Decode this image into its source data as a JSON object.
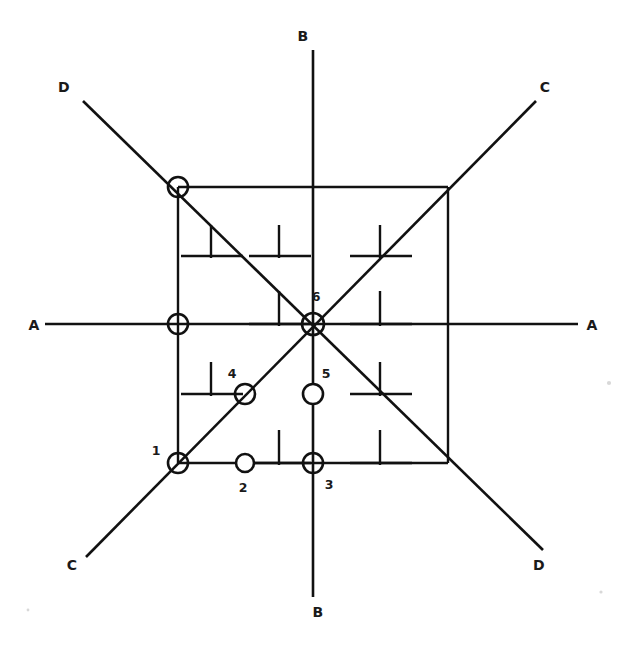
{
  "figure": {
    "type": "engineering-grid-diagram",
    "background_color": "#ffffff",
    "line_color": "#111111",
    "width": 629,
    "height": 659
  },
  "axis_labels": [
    {
      "id": "A-left",
      "text": "A",
      "x": 40,
      "y": 325
    },
    {
      "id": "A-right",
      "text": "A",
      "x": 592,
      "y": 325
    },
    {
      "id": "B-top",
      "text": "B",
      "x": 303,
      "y": 40
    },
    {
      "id": "B-bottom",
      "text": "B",
      "x": 303,
      "y": 615
    },
    {
      "id": "C-top-right",
      "text": "C",
      "x": 541,
      "y": 90
    },
    {
      "id": "C-bottom-left",
      "text": "C",
      "x": 72,
      "y": 568
    },
    {
      "id": "D-top-left",
      "text": "D",
      "x": 64,
      "y": 90
    },
    {
      "id": "D-bottom-right",
      "text": "D",
      "x": 537,
      "y": 568
    }
  ],
  "node_labels": [
    {
      "id": "label-1",
      "text": "1",
      "x": 155,
      "y": 455
    },
    {
      "id": "label-2",
      "text": "2",
      "x": 241,
      "y": 491
    },
    {
      "id": "label-3",
      "text": "3",
      "x": 327,
      "y": 488
    },
    {
      "id": "label-4",
      "text": "4",
      "x": 232,
      "y": 377
    },
    {
      "id": "label-5",
      "text": "5",
      "x": 325,
      "y": 377
    },
    {
      "id": "label-6",
      "text": "6",
      "x": 315,
      "y": 300
    }
  ],
  "nodes": [
    {
      "id": "node-corner-tl",
      "label": "",
      "cx": 178,
      "cy": 187,
      "r": 10
    },
    {
      "id": "node-mid-left",
      "label": "",
      "cx": 178,
      "cy": 324,
      "r": 10
    },
    {
      "id": "node-1",
      "label": "1",
      "cx": 178,
      "cy": 463,
      "r": 10
    },
    {
      "id": "node-2",
      "label": "2",
      "cx": 245,
      "cy": 463,
      "r": 9
    },
    {
      "id": "node-3",
      "label": "3",
      "cx": 313,
      "cy": 463,
      "r": 10
    },
    {
      "id": "node-4",
      "label": "4",
      "cx": 245,
      "cy": 394,
      "r": 10
    },
    {
      "id": "node-5",
      "label": "5",
      "cx": 313,
      "cy": 394,
      "r": 10
    },
    {
      "id": "node-6",
      "label": "6",
      "cx": 313,
      "cy": 324,
      "r": 11
    }
  ],
  "square": {
    "left": 178,
    "top": 187,
    "right": 448,
    "bottom": 463
  },
  "axes": {
    "horizontal_A": {
      "x1": 45,
      "y1": 324,
      "x2": 578,
      "y2": 324
    },
    "vertical_B": {
      "x1": 313,
      "y1": 50,
      "x2": 313,
      "y2": 597
    },
    "diagonal_D": {
      "x1": 83,
      "y1": 101,
      "x2": 543,
      "y2": 550
    },
    "diagonal_C": {
      "x1": 86,
      "y1": 557,
      "x2": 536,
      "y2": 101
    }
  },
  "tick_marks": [
    {
      "id": "tick-r1-c1",
      "x": 211,
      "y": 255
    },
    {
      "id": "tick-r1-c2",
      "x": 279,
      "y": 255
    },
    {
      "id": "tick-r1-c3",
      "x": 380,
      "y": 255
    },
    {
      "id": "tick-r2-c2",
      "x": 279,
      "y": 324
    },
    {
      "id": "tick-r2-c3",
      "x": 380,
      "y": 324
    },
    {
      "id": "tick-r3-c1",
      "x": 211,
      "y": 394
    },
    {
      "id": "tick-r3-c3",
      "x": 380,
      "y": 394
    },
    {
      "id": "tick-r4-c2",
      "x": 279,
      "y": 463
    },
    {
      "id": "tick-r4-c3",
      "x": 380,
      "y": 463
    }
  ]
}
